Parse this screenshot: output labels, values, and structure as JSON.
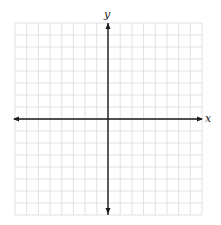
{
  "figure": {
    "type": "coordinate-plane",
    "x_axis_label": "x",
    "y_axis_label": "y",
    "grid": {
      "columns": 16,
      "rows": 16,
      "left": 15,
      "top": 23,
      "right": 202,
      "bottom": 215,
      "line_color": "#d9d9d9"
    },
    "origin": {
      "x": 108,
      "y": 119
    },
    "axis_color": "#1a1a1a"
  }
}
